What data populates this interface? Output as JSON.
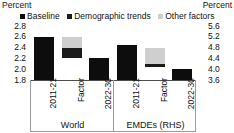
{
  "chart_data": {
    "type": "bar",
    "title": "",
    "subtitle": "",
    "unit_label_left": "Percent",
    "unit_label_right": "Percent",
    "xlabel": "",
    "ylabel": "",
    "grid": false,
    "legend_position": "top-center",
    "legend": [
      {
        "name": "Baseline",
        "color": "#0d0d0d",
        "marker": "square"
      },
      {
        "name": "Demographic trends",
        "color": "#1c1c1c",
        "marker": "square"
      },
      {
        "name": "Other factors",
        "color": "#cfcfcf",
        "marker": "square"
      }
    ],
    "axes": [
      {
        "id": "left",
        "title": "Percent",
        "side": "left",
        "ylim": [
          1.8,
          2.8
        ],
        "ytick_step": 0.2,
        "yticks": [
          "2.8",
          "2.6",
          "2.4",
          "2.2",
          "2.0",
          "1.8"
        ]
      },
      {
        "id": "right",
        "title": "Percent",
        "side": "right",
        "ylim": [
          3.6,
          5.6
        ],
        "ytick_step": 0.4,
        "yticks": [
          "5.6",
          "5.2",
          "4.8",
          "4.4",
          "4.0",
          "3.6"
        ]
      }
    ],
    "panels": [
      {
        "name": "World",
        "axis": "left",
        "categories": [
          "2011-21",
          "Factor",
          "2022-30"
        ],
        "bars": [
          {
            "category": "2011-21",
            "segments": [
              {
                "series": "Baseline",
                "from": 1.8,
                "to": 2.6,
                "color": "#0d0d0d"
              }
            ]
          },
          {
            "category": "Factor",
            "segments": [
              {
                "series": "Demographic trends",
                "from": 2.2,
                "to": 2.4,
                "color": "#1c1c1c"
              },
              {
                "series": "Other factors",
                "from": 2.4,
                "to": 2.6,
                "color": "#cfcfcf"
              }
            ]
          },
          {
            "category": "2022-30",
            "segments": [
              {
                "series": "Baseline",
                "from": 1.8,
                "to": 2.2,
                "color": "#0d0d0d"
              }
            ]
          }
        ]
      },
      {
        "name": "EMDEs (RHS)",
        "axis": "right",
        "categories": [
          "2011-21",
          "Factor",
          "2022-30"
        ],
        "bars": [
          {
            "category": "2011-21",
            "segments": [
              {
                "series": "Baseline",
                "from": 3.6,
                "to": 4.9,
                "color": "#0d0d0d"
              }
            ]
          },
          {
            "category": "Factor",
            "segments": [
              {
                "series": "Demographic trends",
                "from": 4.1,
                "to": 4.2,
                "color": "#1c1c1c"
              },
              {
                "series": "Other factors",
                "from": 4.2,
                "to": 4.8,
                "color": "#cfcfcf"
              }
            ]
          },
          {
            "category": "2022-30",
            "segments": [
              {
                "series": "Baseline",
                "from": 3.6,
                "to": 4.0,
                "color": "#0d0d0d"
              }
            ]
          }
        ]
      }
    ]
  },
  "colors": {
    "baseline": "#0d0d0d",
    "demographic_trends": "#1c1c1c",
    "other_factors": "#cfcfcf",
    "axis": "#4d4d4d",
    "frame": "#9a9a9a",
    "background": "#ffffff"
  }
}
